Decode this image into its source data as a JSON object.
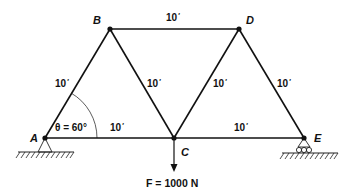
{
  "diagram": {
    "type": "truss",
    "nodes": {
      "A": {
        "label": "A",
        "x": 45,
        "y": 138
      },
      "B": {
        "label": "B",
        "x": 110,
        "y": 29
      },
      "C": {
        "label": "C",
        "x": 174,
        "y": 138
      },
      "D": {
        "label": "D",
        "x": 239,
        "y": 29
      },
      "E": {
        "label": "E",
        "x": 304,
        "y": 138
      }
    },
    "members": [
      {
        "from": "A",
        "to": "B",
        "length_label": "10",
        "unit_mark": "′"
      },
      {
        "from": "B",
        "to": "D",
        "length_label": "10",
        "unit_mark": "′"
      },
      {
        "from": "B",
        "to": "C",
        "length_label": "10",
        "unit_mark": "′"
      },
      {
        "from": "C",
        "to": "D",
        "length_label": "10",
        "unit_mark": "′"
      },
      {
        "from": "D",
        "to": "E",
        "length_label": "10",
        "unit_mark": "′"
      },
      {
        "from": "A",
        "to": "C",
        "length_label": "10",
        "unit_mark": "′"
      },
      {
        "from": "C",
        "to": "E",
        "length_label": "10",
        "unit_mark": "′"
      }
    ],
    "angle": {
      "at": "A",
      "symbol": "θ",
      "text": "θ = 60°"
    },
    "supports": {
      "A": "pin",
      "E": "roller"
    },
    "load": {
      "at": "C",
      "direction": "down",
      "text": "F = 1000 N"
    },
    "colors": {
      "line": "#111111",
      "background": "#ffffff"
    }
  }
}
